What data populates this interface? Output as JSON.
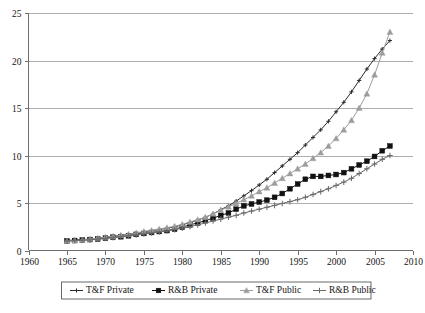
{
  "chart_data": {
    "type": "line",
    "title": "",
    "xlabel": "",
    "ylabel": "",
    "xlim": [
      1960,
      2010
    ],
    "ylim": [
      0,
      25
    ],
    "grid": true,
    "legend_position": "bottom",
    "xticks": [
      1960,
      1965,
      1970,
      1975,
      1980,
      1985,
      1990,
      1995,
      2000,
      2005,
      2010
    ],
    "yticks": [
      0,
      5,
      10,
      15,
      20,
      25
    ],
    "x": [
      1965,
      1966,
      1967,
      1968,
      1969,
      1970,
      1971,
      1972,
      1973,
      1974,
      1975,
      1976,
      1977,
      1978,
      1979,
      1980,
      1981,
      1982,
      1983,
      1984,
      1985,
      1986,
      1987,
      1988,
      1989,
      1990,
      1991,
      1992,
      1993,
      1994,
      1995,
      1996,
      1997,
      1998,
      1999,
      2000,
      2001,
      2002,
      2003,
      2004,
      2005,
      2006,
      2007
    ],
    "series": [
      {
        "name": "T&F Private",
        "color": "#2b2b2b",
        "marker": "cross",
        "values": [
          1.05,
          1.1,
          1.15,
          1.2,
          1.3,
          1.4,
          1.5,
          1.6,
          1.7,
          1.8,
          1.95,
          2.1,
          2.2,
          2.35,
          2.5,
          2.7,
          2.95,
          3.2,
          3.5,
          3.85,
          4.3,
          4.7,
          5.2,
          5.75,
          6.3,
          6.9,
          7.5,
          8.2,
          8.9,
          9.6,
          10.3,
          11.1,
          11.9,
          12.7,
          13.6,
          14.6,
          15.6,
          16.7,
          17.9,
          19.1,
          20.2,
          21.2,
          22.1
        ]
      },
      {
        "name": "R&B Private",
        "color": "#111111",
        "marker": "square",
        "values": [
          1.0,
          1.05,
          1.1,
          1.15,
          1.2,
          1.3,
          1.4,
          1.45,
          1.55,
          1.7,
          1.8,
          1.9,
          2.0,
          2.1,
          2.25,
          2.45,
          2.7,
          2.9,
          3.15,
          3.4,
          3.7,
          3.95,
          4.35,
          4.7,
          4.9,
          5.1,
          5.3,
          5.6,
          6.0,
          6.5,
          7.0,
          7.5,
          7.8,
          7.8,
          7.9,
          8.0,
          8.2,
          8.6,
          9.0,
          9.4,
          9.9,
          10.5,
          11.0
        ]
      },
      {
        "name": "T&F Public",
        "color": "#9d9d9d",
        "marker": "triangle",
        "values": [
          1.0,
          1.05,
          1.1,
          1.2,
          1.3,
          1.4,
          1.5,
          1.6,
          1.7,
          1.85,
          2.0,
          2.1,
          2.25,
          2.4,
          2.55,
          2.75,
          3.0,
          3.25,
          3.5,
          3.85,
          4.25,
          4.6,
          4.95,
          5.35,
          5.75,
          6.2,
          6.6,
          7.1,
          7.6,
          8.1,
          8.6,
          9.1,
          9.7,
          10.3,
          11.0,
          11.8,
          12.7,
          13.7,
          15.0,
          16.5,
          18.5,
          20.8,
          23.0
        ]
      },
      {
        "name": "R&B Public",
        "color": "#6b6b6b",
        "marker": "plus",
        "values": [
          1.0,
          1.05,
          1.08,
          1.12,
          1.2,
          1.28,
          1.36,
          1.44,
          1.55,
          1.65,
          1.75,
          1.85,
          1.95,
          2.05,
          2.2,
          2.35,
          2.5,
          2.7,
          2.9,
          3.1,
          3.3,
          3.5,
          3.7,
          3.95,
          4.15,
          4.35,
          4.55,
          4.75,
          4.95,
          5.15,
          5.35,
          5.6,
          5.9,
          6.2,
          6.5,
          6.85,
          7.2,
          7.6,
          8.1,
          8.6,
          9.1,
          9.6,
          10.0
        ]
      }
    ]
  },
  "legend": {
    "items": [
      {
        "label": "T&F Private"
      },
      {
        "label": "R&B Private"
      },
      {
        "label": "T&F Public"
      },
      {
        "label": "R&B Public"
      }
    ]
  }
}
